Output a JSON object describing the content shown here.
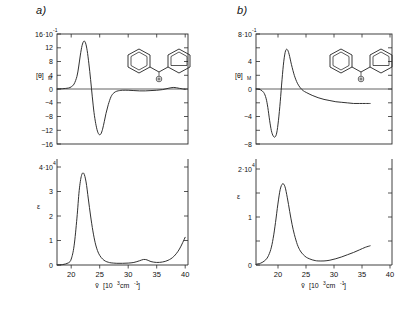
{
  "figure": {
    "background": "#ffffff",
    "curve_color": "#262626",
    "axis_color": "#2b2b2b",
    "width": 407,
    "height": 317
  },
  "panels": [
    {
      "id": "a",
      "label": "a)",
      "inset_molecule": {
        "name": "benzhydryl-cation",
        "charge_symbol": "⊕",
        "rings": 2
      },
      "mcd": {
        "ylabel": "[θ]",
        "ylabel_sub": "M",
        "ytick_top_mantissa": "16·10",
        "ytick_top_exp": "-1",
        "yticks": [
          "16·10",
          "12",
          "8",
          "4",
          "0",
          "−4",
          "−8",
          "−12",
          "−16"
        ]
      },
      "abs": {
        "ylabel": "ε",
        "ytick_top_mantissa": "4·10",
        "ytick_top_exp": "4",
        "yticks": [
          "4·10",
          "3",
          "2",
          "1",
          "0"
        ]
      },
      "xaxis": {
        "label_var": "ṽ",
        "label_unit": "[10",
        "label_unit_exp": "3",
        "label_unit_tail": " cm",
        "label_unit_exp2": "-1",
        "label_unit_close": "]",
        "ticks": [
          "20",
          "25",
          "30",
          "35",
          "40"
        ]
      }
    },
    {
      "id": "b",
      "label": "b)",
      "inset_molecule": {
        "name": "benzhydryl-cation",
        "charge_symbol": "⊕",
        "rings": 2
      },
      "mcd": {
        "ylabel": "[θ]",
        "ylabel_sub": "M",
        "ytick_top_mantissa": "8·10",
        "ytick_top_exp": "-1",
        "yticks": [
          "8·10",
          "4",
          "0",
          "−4",
          "−8"
        ]
      },
      "abs": {
        "ylabel": "ε",
        "ytick_top_mantissa": "2·10",
        "ytick_top_exp": "4",
        "yticks": [
          "2·10",
          "1",
          "0"
        ]
      },
      "xaxis": {
        "label_var": "ṽ",
        "label_unit": "[10",
        "label_unit_exp": "3",
        "label_unit_tail": " cm",
        "label_unit_exp2": "-1",
        "label_unit_close": "]",
        "ticks": [
          "20",
          "25",
          "30",
          "35",
          "40"
        ]
      }
    }
  ],
  "chart_data": [
    {
      "type": "line",
      "id": "a-mcd",
      "title": "a) MCD spectrum of benzhydryl cation",
      "xlabel": "ṽ [10³ cm⁻¹]",
      "ylabel": "[θ]_M",
      "xlim": [
        17.5,
        40.5
      ],
      "ylim": [
        -17.5,
        17.5
      ],
      "yunit": "10^-1",
      "grid": false,
      "legend": "none",
      "x": [
        17.5,
        18.5,
        19.5,
        20.0,
        20.5,
        21.0,
        21.3,
        21.6,
        21.9,
        22.2,
        22.5,
        22.8,
        23.1,
        23.4,
        23.7,
        24.0,
        24.3,
        24.6,
        24.9,
        25.2,
        25.5,
        25.8,
        26.1,
        26.5,
        27.0,
        27.5,
        28.0,
        28.5,
        29.0,
        30.0,
        31.0,
        32.0,
        33.0,
        34.0,
        35.0,
        36.0,
        37.0,
        38.0,
        39.0,
        40.0
      ],
      "y": [
        0.0,
        0.1,
        0.3,
        0.7,
        1.6,
        4.0,
        7.0,
        10.8,
        13.8,
        15.2,
        14.7,
        12.2,
        8.0,
        3.0,
        -2.5,
        -7.5,
        -11.0,
        -13.4,
        -14.5,
        -14.3,
        -12.8,
        -10.4,
        -7.8,
        -5.0,
        -2.4,
        -1.2,
        -0.7,
        -0.5,
        -0.4,
        -0.4,
        -0.5,
        -0.6,
        -0.6,
        -0.5,
        -0.4,
        -0.2,
        0.2,
        0.5,
        0.2,
        -0.1
      ]
    },
    {
      "type": "line",
      "id": "a-abs",
      "title": "a) Absorption spectrum of benzhydryl cation",
      "xlabel": "ṽ [10³ cm⁻¹]",
      "ylabel": "ε",
      "xlim": [
        17.5,
        40.5
      ],
      "ylim": [
        0,
        4.6
      ],
      "yunit": "10^4",
      "grid": false,
      "legend": "none",
      "x": [
        17.5,
        18.5,
        19.5,
        20.0,
        20.5,
        21.0,
        21.4,
        21.8,
        22.2,
        22.6,
        23.0,
        23.4,
        23.8,
        24.2,
        24.6,
        25.0,
        25.5,
        26.0,
        26.5,
        27.0,
        28.0,
        29.0,
        30.0,
        31.0,
        32.0,
        32.7,
        33.3,
        34.0,
        35.0,
        36.0,
        37.0,
        38.0,
        39.0,
        40.0
      ],
      "y": [
        0.0,
        0.02,
        0.1,
        0.28,
        0.9,
        2.2,
        3.5,
        4.2,
        4.3,
        3.9,
        3.1,
        2.3,
        1.6,
        1.05,
        0.68,
        0.45,
        0.28,
        0.18,
        0.13,
        0.1,
        0.08,
        0.08,
        0.09,
        0.12,
        0.2,
        0.26,
        0.24,
        0.16,
        0.12,
        0.14,
        0.22,
        0.4,
        0.75,
        1.3
      ]
    },
    {
      "type": "line",
      "id": "b-mcd",
      "title": "b) MCD spectrum of benzhydryl cation",
      "xlabel": "ṽ [10³ cm⁻¹]",
      "ylabel": "[θ]_M",
      "xlim": [
        17.5,
        40.5
      ],
      "ylim": [
        -9.5,
        9.5
      ],
      "yunit": "10^-1",
      "grid": false,
      "legend": "none",
      "x": [
        17.5,
        18.2,
        18.8,
        19.2,
        19.5,
        19.8,
        20.1,
        20.4,
        20.7,
        21.0,
        21.3,
        21.6,
        21.9,
        22.2,
        22.5,
        22.8,
        23.1,
        23.5,
        24.0,
        24.5,
        25.0,
        25.5,
        26.0,
        27.0,
        28.0,
        29.0,
        30.0,
        31.0,
        32.0,
        33.0,
        34.0,
        35.0,
        36.0,
        36.8
      ],
      "y": [
        0.0,
        -0.1,
        -0.6,
        -1.6,
        -3.2,
        -5.4,
        -7.2,
        -8.1,
        -8.3,
        -7.6,
        -5.4,
        -2.2,
        1.6,
        4.8,
        6.6,
        6.8,
        6.0,
        4.2,
        2.3,
        1.0,
        0.2,
        -0.3,
        -0.6,
        -1.1,
        -1.5,
        -1.8,
        -2.0,
        -2.2,
        -2.3,
        -2.4,
        -2.5,
        -2.5,
        -2.5,
        -2.5
      ]
    },
    {
      "type": "line",
      "id": "b-abs",
      "title": "b) Absorption spectrum of benzhydryl cation",
      "xlabel": "ṽ [10³ cm⁻¹]",
      "ylabel": "ε",
      "xlim": [
        17.5,
        40.5
      ],
      "ylim": [
        0,
        2.6
      ],
      "yunit": "10^4",
      "grid": false,
      "legend": "none",
      "x": [
        17.5,
        18.3,
        19.0,
        19.5,
        20.0,
        20.4,
        20.8,
        21.2,
        21.6,
        22.0,
        22.4,
        22.8,
        23.2,
        23.6,
        24.0,
        24.5,
        25.0,
        25.5,
        26.0,
        26.5,
        27.0,
        27.5,
        28.0,
        29.0,
        30.0,
        31.0,
        32.0,
        33.0,
        34.0,
        35.0,
        36.0,
        36.8
      ],
      "y": [
        0.02,
        0.05,
        0.12,
        0.22,
        0.42,
        0.72,
        1.15,
        1.65,
        2.05,
        2.2,
        2.12,
        1.82,
        1.45,
        1.1,
        0.82,
        0.55,
        0.38,
        0.28,
        0.21,
        0.17,
        0.14,
        0.12,
        0.11,
        0.11,
        0.13,
        0.17,
        0.22,
        0.28,
        0.34,
        0.41,
        0.48,
        0.52
      ]
    }
  ]
}
